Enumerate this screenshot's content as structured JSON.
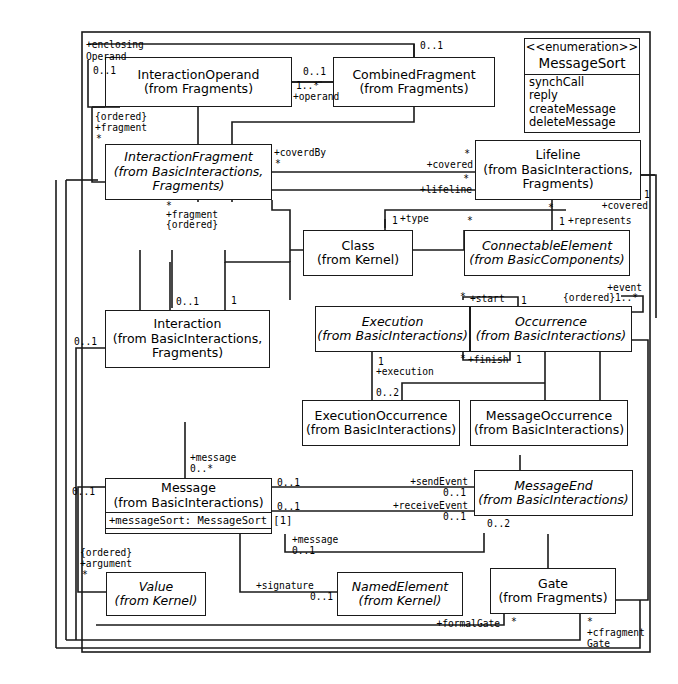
{
  "diagram": {
    "stroke_color": "#1a1a1a",
    "background_color": "#ffffff"
  },
  "classes": [
    {
      "id": "interactionoperand",
      "name": "InteractionOperand",
      "from": "(from Fragments)",
      "abstract": false
    },
    {
      "id": "combinedfragment",
      "name": "CombinedFragment",
      "from": "(from Fragments)",
      "abstract": false
    },
    {
      "id": "interactionfragment",
      "name": "InteractionFragment",
      "from": "(from BasicInteractions,",
      "from2": "Fragments)",
      "abstract": true
    },
    {
      "id": "lifeline",
      "name": "Lifeline",
      "from": "(from BasicInteractions,",
      "from2": "Fragments)",
      "abstract": false
    },
    {
      "id": "class",
      "name": "Class",
      "from": "(from Kernel)",
      "abstract": false
    },
    {
      "id": "connectableelement",
      "name": "ConnectableElement",
      "from": "(from BasicComponents)",
      "abstract": true
    },
    {
      "id": "interaction",
      "name": "Interaction",
      "from": "(from BasicInteractions,",
      "from2": "Fragments)",
      "abstract": false
    },
    {
      "id": "execution",
      "name": "Execution",
      "from": "(from BasicInteractions)",
      "abstract": true
    },
    {
      "id": "occurrence",
      "name": "Occurrence",
      "from": "(from BasicInteractions)",
      "abstract": true
    },
    {
      "id": "executionoccurrence",
      "name": "ExecutionOccurrence",
      "from": "(from BasicInteractions)",
      "abstract": false
    },
    {
      "id": "messageoccurrence",
      "name": "MessageOccurrence",
      "from": "(from BasicInteractions)",
      "abstract": false
    },
    {
      "id": "message",
      "name": "Message",
      "from": "(from BasicInteractions)",
      "abstract": false,
      "attributes": [
        "+messageSort: MessageSort [1]"
      ]
    },
    {
      "id": "messageend",
      "name": "MessageEnd",
      "from": "(from BasicInteractions)",
      "abstract": true
    },
    {
      "id": "value",
      "name": "Value",
      "from": "(from Kernel)",
      "abstract": true
    },
    {
      "id": "namedelement",
      "name": "NamedElement",
      "from": "(from Kernel)",
      "abstract": true
    },
    {
      "id": "gate",
      "name": "Gate",
      "from": "(from Fragments)",
      "abstract": false
    }
  ],
  "enumeration": {
    "stereotype": "<<enumeration>>",
    "name": "MessageSort",
    "literals": [
      "synchCall",
      "reply",
      "createMessage",
      "deleteMessage"
    ]
  },
  "edge_labels": [
    {
      "id": "enclosing-operand-role",
      "text": "+enclosing"
    },
    {
      "id": "enclosing-operand-role2",
      "text": "Operand"
    },
    {
      "id": "enclosing-operand-mult",
      "text": "0..1"
    },
    {
      "id": "operand-mult",
      "text": "1..*"
    },
    {
      "id": "operand-role",
      "text": "+operand"
    },
    {
      "id": "combinedfragment-mult",
      "text": "0..1"
    },
    {
      "id": "combinedfragment-left-mult",
      "text": "0..1"
    },
    {
      "id": "fragment-ordered",
      "text": "{ordered}"
    },
    {
      "id": "fragment-role",
      "text": "+fragment"
    },
    {
      "id": "fragment-star",
      "text": "*"
    },
    {
      "id": "coverdby-role",
      "text": "+coverdBy"
    },
    {
      "id": "coverdby-star",
      "text": "*"
    },
    {
      "id": "covered-role",
      "text": "+covered"
    },
    {
      "id": "covered-star",
      "text": "*"
    },
    {
      "id": "lifeline-role",
      "text": "+lifeline"
    },
    {
      "id": "lifeline-star",
      "text": "*"
    },
    {
      "id": "fragment2-star",
      "text": "*"
    },
    {
      "id": "fragment2-role",
      "text": "+fragment"
    },
    {
      "id": "fragment2-ordered",
      "text": "{ordered}"
    },
    {
      "id": "type-mult",
      "text": "1"
    },
    {
      "id": "type-role",
      "text": "+type"
    },
    {
      "id": "represents-mult",
      "text": "1"
    },
    {
      "id": "represents-role",
      "text": "+represents"
    },
    {
      "id": "connectable-star",
      "text": "*"
    },
    {
      "id": "lifeline-covered-mult",
      "text": "1"
    },
    {
      "id": "lifeline-covered-role",
      "text": "+covered"
    },
    {
      "id": "interaction-mult",
      "text": "0..1"
    },
    {
      "id": "interaction-mult2",
      "text": "1"
    },
    {
      "id": "interaction-left-mult",
      "text": "0..1"
    },
    {
      "id": "execution-star",
      "text": "*"
    },
    {
      "id": "start-role",
      "text": "+start"
    },
    {
      "id": "start-mult",
      "text": "1"
    },
    {
      "id": "event-role",
      "text": "+event"
    },
    {
      "id": "event-ordered",
      "text": "{ordered}"
    },
    {
      "id": "event-mult",
      "text": "1..*"
    },
    {
      "id": "finish-star",
      "text": "*"
    },
    {
      "id": "finish-role",
      "text": "+finish"
    },
    {
      "id": "finish-mult",
      "text": "1"
    },
    {
      "id": "execution-mult",
      "text": "1"
    },
    {
      "id": "execution-role",
      "text": "+execution"
    },
    {
      "id": "execution-mult2",
      "text": "0..2"
    },
    {
      "id": "message-role",
      "text": "+message"
    },
    {
      "id": "message-mult",
      "text": "0..*"
    },
    {
      "id": "message-left-mult",
      "text": "0..1"
    },
    {
      "id": "sendevent-mult-src",
      "text": "0..1"
    },
    {
      "id": "sendevent-role",
      "text": "+sendEvent"
    },
    {
      "id": "sendevent-mult",
      "text": "0..1"
    },
    {
      "id": "receiveevent-mult-src",
      "text": "0..1"
    },
    {
      "id": "receiveevent-role",
      "text": "+receiveEvent"
    },
    {
      "id": "receiveevent-mult",
      "text": "0..1"
    },
    {
      "id": "messageend-mult",
      "text": "0..2"
    },
    {
      "id": "message2-role",
      "text": "+message"
    },
    {
      "id": "message2-mult",
      "text": "0..1"
    },
    {
      "id": "argument-ordered",
      "text": "{ordered}"
    },
    {
      "id": "argument-role",
      "text": "+argument"
    },
    {
      "id": "argument-star",
      "text": "*"
    },
    {
      "id": "signature-role",
      "text": "+signature"
    },
    {
      "id": "signature-mult",
      "text": "0..1"
    },
    {
      "id": "formalgate-role",
      "text": "+formalGate"
    },
    {
      "id": "formalgate-star",
      "text": "*"
    },
    {
      "id": "cfragment-star",
      "text": "*"
    },
    {
      "id": "cfragmentgate-role",
      "text": "+cfragment"
    },
    {
      "id": "cfragmentgate-role2",
      "text": "Gate"
    }
  ]
}
